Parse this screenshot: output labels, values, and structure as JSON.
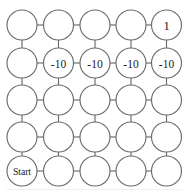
{
  "figure": {
    "name": "gridworld-graph",
    "type": "grid-graph",
    "rows": 5,
    "cols": 5,
    "background_color": "#ffffff",
    "node_fill_color": "#ffffff",
    "node_stroke_color": "#6b6b6b",
    "edge_color": "#6b6b6b",
    "label_color": "#1c1c1c",
    "node_radius": 15,
    "col_centers": [
      22,
      58.5,
      95,
      131,
      166.5
    ],
    "row_centers": [
      25,
      63,
      100,
      137,
      171
    ]
  },
  "nodes": [
    {
      "id": "r1c1",
      "row": 0,
      "col": 0,
      "label": "",
      "kind": "empty"
    },
    {
      "id": "r1c2",
      "row": 0,
      "col": 1,
      "label": "",
      "kind": "empty"
    },
    {
      "id": "r1c3",
      "row": 0,
      "col": 2,
      "label": "",
      "kind": "empty"
    },
    {
      "id": "r1c4",
      "row": 0,
      "col": 3,
      "label": "",
      "kind": "empty"
    },
    {
      "id": "r1c5",
      "row": 0,
      "col": 4,
      "label": "1",
      "kind": "goal"
    },
    {
      "id": "r2c1",
      "row": 1,
      "col": 0,
      "label": "",
      "kind": "empty"
    },
    {
      "id": "r2c2",
      "row": 1,
      "col": 1,
      "label": "-10",
      "kind": "penalty"
    },
    {
      "id": "r2c3",
      "row": 1,
      "col": 2,
      "label": "-10",
      "kind": "penalty"
    },
    {
      "id": "r2c4",
      "row": 1,
      "col": 3,
      "label": "-10",
      "kind": "penalty"
    },
    {
      "id": "r2c5",
      "row": 1,
      "col": 4,
      "label": "-10",
      "kind": "penalty"
    },
    {
      "id": "r3c1",
      "row": 2,
      "col": 0,
      "label": "",
      "kind": "empty"
    },
    {
      "id": "r3c2",
      "row": 2,
      "col": 1,
      "label": "",
      "kind": "empty"
    },
    {
      "id": "r3c3",
      "row": 2,
      "col": 2,
      "label": "",
      "kind": "empty"
    },
    {
      "id": "r3c4",
      "row": 2,
      "col": 3,
      "label": "",
      "kind": "empty"
    },
    {
      "id": "r3c5",
      "row": 2,
      "col": 4,
      "label": "",
      "kind": "empty"
    },
    {
      "id": "r4c1",
      "row": 3,
      "col": 0,
      "label": "",
      "kind": "empty"
    },
    {
      "id": "r4c2",
      "row": 3,
      "col": 1,
      "label": "",
      "kind": "empty"
    },
    {
      "id": "r4c3",
      "row": 3,
      "col": 2,
      "label": "",
      "kind": "empty"
    },
    {
      "id": "r4c4",
      "row": 3,
      "col": 3,
      "label": "",
      "kind": "empty"
    },
    {
      "id": "r4c5",
      "row": 3,
      "col": 4,
      "label": "",
      "kind": "empty"
    },
    {
      "id": "r5c1",
      "row": 4,
      "col": 0,
      "label": "Start",
      "kind": "start"
    },
    {
      "id": "r5c2",
      "row": 4,
      "col": 1,
      "label": "",
      "kind": "empty"
    },
    {
      "id": "r5c3",
      "row": 4,
      "col": 2,
      "label": "",
      "kind": "empty"
    },
    {
      "id": "r5c4",
      "row": 4,
      "col": 3,
      "label": "",
      "kind": "empty"
    },
    {
      "id": "r5c5",
      "row": 4,
      "col": 4,
      "label": "",
      "kind": "empty"
    }
  ],
  "labels": {
    "goal_value": "1",
    "penalty_value": "-10",
    "start_text": "Start"
  }
}
